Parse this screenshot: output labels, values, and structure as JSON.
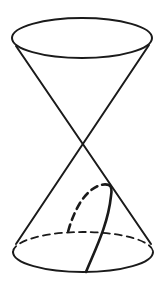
{
  "diagram": {
    "type": "double-cone",
    "colors": {
      "stroke": "#1a1a1a",
      "background": "#ffffff"
    },
    "top_ellipse": {
      "cx": 82,
      "cy": 38,
      "rx": 70,
      "ry": 20
    },
    "bottom_ellipse": {
      "cx": 83,
      "cy": 252,
      "rx": 70,
      "ry": 20
    },
    "apex": {
      "x": 82,
      "y": 144
    }
  }
}
